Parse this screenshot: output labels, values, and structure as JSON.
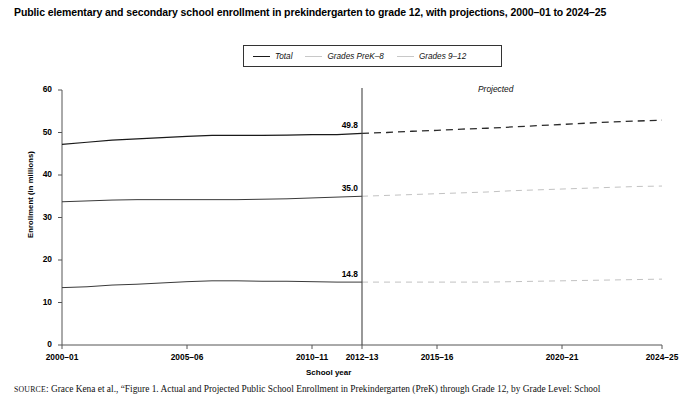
{
  "title": "Public elementary and secondary school enrollment in prekindergarten to grade 12, with projections, 2000–01 to 2024–25",
  "source_prefix": "SOURCE",
  "source_text": ": Grace Kena et al., “Figure 1. Actual and Projected Public School Enrollment in Prekindergarten (PreK) through Grade 12, by Grade Level: School",
  "annotations": {
    "projected": "Projected"
  },
  "colors": {
    "total": "#1a1a1a",
    "prek8": "#c8c8c8",
    "grades912": "#c8c8c8",
    "axis": "#555555",
    "divider": "#444444",
    "text": "#000000"
  },
  "chart_data": {
    "type": "line",
    "title": "Public elementary and secondary school enrollment in prekindergarten to grade 12, with projections, 2000–01 to 2024–25",
    "xlabel": "School year",
    "ylabel": "Enrollment (in millions)",
    "ylim": [
      0,
      60
    ],
    "yticks": [
      0,
      10,
      20,
      30,
      40,
      50,
      60
    ],
    "ytick_labels": [
      "0",
      "10",
      "20",
      "30",
      "40",
      "50",
      "60"
    ],
    "xlim": [
      2000,
      2024
    ],
    "xticks": [
      2000,
      2005,
      2010,
      2012,
      2015,
      2020,
      2024
    ],
    "xtick_labels": [
      "2000–01",
      "2005–06",
      "2010–11",
      "2012–13",
      "2015–16",
      "2020–21",
      "2024–25"
    ],
    "grid": false,
    "legend_position": "top-center",
    "projection_start": 2012,
    "projection_divider_label": "2012–13",
    "x": [
      2000,
      2001,
      2002,
      2003,
      2004,
      2005,
      2006,
      2007,
      2008,
      2009,
      2010,
      2011,
      2012,
      2013,
      2014,
      2015,
      2016,
      2017,
      2018,
      2019,
      2020,
      2021,
      2022,
      2023,
      2024
    ],
    "series": [
      {
        "name": "Total",
        "color": "#1a1a1a",
        "actual_values": [
          47.2,
          47.7,
          48.2,
          48.5,
          48.8,
          49.1,
          49.3,
          49.3,
          49.3,
          49.4,
          49.5,
          49.5,
          49.8
        ],
        "projected_values": [
          49.8,
          50.0,
          50.3,
          50.5,
          50.8,
          51.0,
          51.3,
          51.6,
          51.9,
          52.2,
          52.5,
          52.7,
          52.9
        ],
        "label_at_divider": "49.8"
      },
      {
        "name": "Grades PreK–8",
        "color": "#c8c8c8",
        "actual_values": [
          33.7,
          33.9,
          34.1,
          34.2,
          34.2,
          34.2,
          34.2,
          34.2,
          34.3,
          34.4,
          34.6,
          34.8,
          35.0
        ],
        "projected_values": [
          35.0,
          35.2,
          35.4,
          35.6,
          35.8,
          36.0,
          36.3,
          36.5,
          36.7,
          36.9,
          37.1,
          37.3,
          37.4
        ],
        "label_at_divider": "35.0"
      },
      {
        "name": "Grades 9–12",
        "color": "#c8c8c8",
        "actual_values": [
          13.5,
          13.7,
          14.1,
          14.3,
          14.6,
          14.9,
          15.1,
          15.1,
          15.0,
          15.0,
          14.9,
          14.8,
          14.8
        ],
        "projected_values": [
          14.8,
          14.8,
          14.8,
          14.8,
          14.8,
          14.8,
          14.9,
          15.0,
          15.1,
          15.2,
          15.3,
          15.4,
          15.5
        ],
        "label_at_divider": "14.8"
      }
    ],
    "value_labels": [
      {
        "text": "49.8",
        "series": "Total"
      },
      {
        "text": "35.0",
        "series": "Grades PreK–8"
      },
      {
        "text": "14.8",
        "series": "Grades 9–12"
      }
    ]
  }
}
